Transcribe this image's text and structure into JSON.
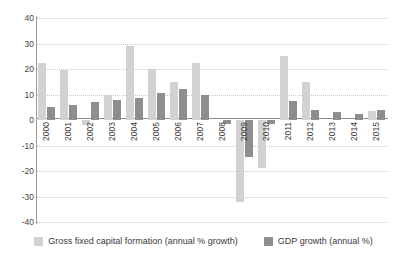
{
  "chart_data": {
    "type": "bar",
    "title": "",
    "subtitle": "",
    "xlabel": "",
    "ylabel": "",
    "ylim": [
      -40,
      40
    ],
    "ytick_labels": [
      "40",
      "30",
      "20",
      "10",
      "0",
      "-10",
      "-20",
      "-30",
      "-40"
    ],
    "ytick_values": [
      40,
      30,
      20,
      10,
      0,
      -10,
      -20,
      -30,
      -40
    ],
    "grid": true,
    "legend_position": "bottom",
    "categories": [
      "2000",
      "2001",
      "2002",
      "2003",
      "2004",
      "2005",
      "2006",
      "2007",
      "2008",
      "2009",
      "2010",
      "2011",
      "2012",
      "2013",
      "2014",
      "2015"
    ],
    "series": [
      {
        "name": "Gross fixed capital formation (annual % growth)",
        "color": "#d2d2d2",
        "values": [
          22.5,
          19.5,
          -2.0,
          10.0,
          29.0,
          20.0,
          15.0,
          22.5,
          0.0,
          -32.0,
          -19.0,
          25.0,
          15.0,
          0.0,
          0.0,
          3.5
        ]
      },
      {
        "name": "GDP growth (annual %)",
        "color": "#8e8e8e",
        "values": [
          5.0,
          6.0,
          7.0,
          8.0,
          8.5,
          10.5,
          12.0,
          10.0,
          -1.5,
          -14.5,
          -1.5,
          7.5,
          4.0,
          3.0,
          2.5,
          4.0
        ]
      }
    ]
  },
  "legend": {
    "items": [
      {
        "label": "Gross fixed capital formation (annual % growth)"
      },
      {
        "label": "GDP growth (annual %)"
      }
    ]
  }
}
